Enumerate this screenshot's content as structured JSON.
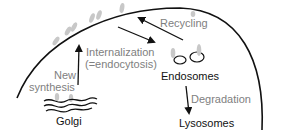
{
  "diagram": {
    "colors": {
      "line": "#111111",
      "label_gray": "#808080",
      "receptor": "#c8c8c8"
    },
    "nodes": {
      "golgi": "Golgi",
      "endosomes": "Endosomes",
      "lysosomes": "Lysosomes"
    },
    "processes": {
      "new_synthesis_line1": "New",
      "new_synthesis_line2": "synthesis",
      "internalization_line1": "Internalization",
      "internalization_line2": "(=endocytosis)",
      "recycling": "Recycling",
      "degradation": "Degradation"
    },
    "edges": [
      {
        "from": "Golgi",
        "to": "Plasma membrane",
        "label": "New synthesis"
      },
      {
        "from": "Plasma membrane",
        "to": "Endosomes",
        "label": "Internalization (=endocytosis)"
      },
      {
        "from": "Endosomes",
        "to": "Plasma membrane",
        "label": "Recycling"
      },
      {
        "from": "Endosomes",
        "to": "Lysosomes",
        "label": "Degradation"
      }
    ]
  }
}
